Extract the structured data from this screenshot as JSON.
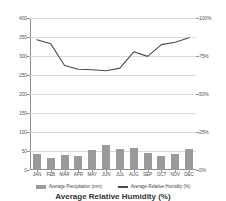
{
  "chart_data": {
    "type": "bar",
    "title": "Average Relative Humidity (%)",
    "xlabel": "",
    "ylabel": "",
    "categories": [
      "JAN",
      "FEB",
      "MAR",
      "APR",
      "MAY",
      "JUN",
      "JUL",
      "AUG",
      "SEP",
      "OCT",
      "NOV",
      "DEC"
    ],
    "series": [
      {
        "name": "Average Precipitation (mm)",
        "type": "bar",
        "axis": "left",
        "color": "#9a9a9a",
        "values": [
          41,
          32,
          39,
          36,
          52,
          67,
          54,
          57,
          44,
          36,
          42,
          55
        ]
      },
      {
        "name": "Average Relative Humidity (%)",
        "type": "line",
        "axis": "left",
        "color": "#4b4b4b",
        "values": [
          343,
          332,
          275,
          265,
          264,
          261,
          268,
          311,
          299,
          330,
          336,
          348
        ]
      }
    ],
    "left_axis": {
      "ticks": [
        "0",
        "50",
        "100",
        "150",
        "200",
        "250",
        "300",
        "350",
        "400"
      ],
      "values": [
        0,
        50,
        100,
        150,
        200,
        250,
        300,
        350,
        400
      ],
      "ylim": [
        0,
        400
      ]
    },
    "right_axis": {
      "ticks": [
        "0%",
        "25%",
        "50%",
        "75%",
        "100%"
      ],
      "values": [
        0,
        25,
        50,
        75,
        100
      ],
      "ylim": [
        0,
        100
      ]
    },
    "grid": true,
    "legend_position": "bottom",
    "legend": [
      {
        "label": "Average Precipitation (mm)",
        "marker": "bar-swatch-icon"
      },
      {
        "label": "Average Relative Humidity (%)",
        "marker": "line-swatch-icon"
      }
    ]
  }
}
